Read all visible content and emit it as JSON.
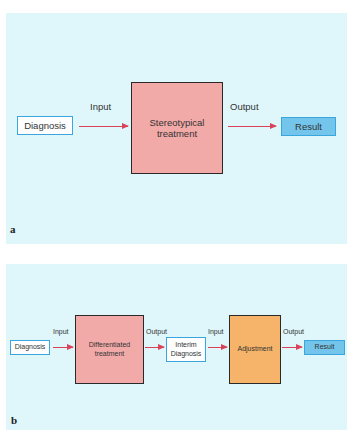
{
  "panel_a": {
    "tag": "a",
    "diagnosis": "Diagnosis",
    "input_label": "Input",
    "process_line1": "Stereotypical",
    "process_line2": "treatment",
    "output_label": "Output",
    "result": "Result"
  },
  "panel_b": {
    "tag": "b",
    "diagnosis": "Diagnosis",
    "input_label_1": "Input",
    "process_line1": "Differentiated",
    "process_line2": "treatment",
    "output_label_1": "Output",
    "interim_line1": "Interim",
    "interim_line2": "Diagnosis",
    "input_label_2": "Input",
    "adjustment": "Adjustment",
    "output_label_2": "Output",
    "result": "Result"
  },
  "colors": {
    "background": "#dff7fb",
    "process_fill": "#f2aaa8",
    "adjustment_fill": "#f5b469",
    "result_fill": "#74c5ec",
    "outline_blue": "#3aa6de",
    "arrow": "#d9435a"
  }
}
